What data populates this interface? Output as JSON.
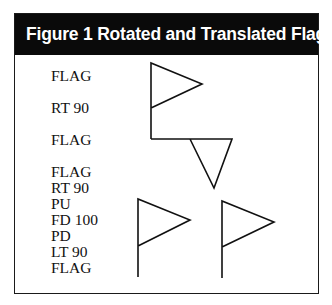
{
  "figure": {
    "title": "Figure 1 Rotated and Translated Flags"
  },
  "commands": {
    "group1": [
      "FLAG",
      "RT 90",
      "FLAG"
    ],
    "group2": [
      "FLAG",
      "RT 90",
      "PU",
      "FD 100",
      "PD",
      "LT 90",
      "FLAG"
    ]
  },
  "drawings": {
    "group1": [
      "upright flag",
      "rotated flag pointing down"
    ],
    "group2": [
      "upright flag",
      "translated upright flag"
    ]
  },
  "colors": {
    "header_bg": "#0a0a0a",
    "header_text": "#ffffff",
    "stroke": "#111111"
  }
}
